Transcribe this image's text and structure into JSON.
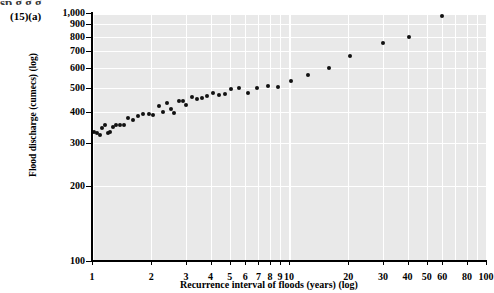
{
  "figure": {
    "label": "(15)(a)",
    "top_cropped_text": "sp g g g"
  },
  "chart_data": {
    "type": "scatter",
    "title": "",
    "xlabel": "Recurrence interval of floods (years) (log)",
    "ylabel": "Flood discharge (cumecs) (log)",
    "xscale": "log",
    "yscale": "log",
    "xlim": [
      1,
      100
    ],
    "ylim": [
      100,
      1000
    ],
    "grid": true,
    "legend": null,
    "marker_color": "#111111",
    "plot_background": "#e9e9e9",
    "gridline_color": "#ffffff",
    "xticks": [
      1,
      2,
      3,
      4,
      5,
      6,
      7,
      8,
      9,
      10,
      20,
      30,
      40,
      50,
      60,
      80,
      100
    ],
    "xtick_labels": [
      "1",
      "2",
      "3",
      "4",
      "5",
      "6",
      "7",
      "8",
      "9",
      "10",
      "20",
      "30",
      "40",
      "50",
      "60",
      "80",
      "100"
    ],
    "yticks": [
      100,
      200,
      300,
      400,
      500,
      600,
      700,
      800,
      900,
      1000
    ],
    "ytick_labels": [
      "100",
      "200",
      "300",
      "400",
      "500",
      "600",
      "700",
      "800",
      "900",
      "1,000"
    ],
    "points": [
      {
        "x": 1.02,
        "y": 330
      },
      {
        "x": 1.06,
        "y": 327
      },
      {
        "x": 1.1,
        "y": 322
      },
      {
        "x": 1.13,
        "y": 345
      },
      {
        "x": 1.16,
        "y": 355
      },
      {
        "x": 1.2,
        "y": 327
      },
      {
        "x": 1.24,
        "y": 330
      },
      {
        "x": 1.28,
        "y": 348
      },
      {
        "x": 1.33,
        "y": 352
      },
      {
        "x": 1.38,
        "y": 355
      },
      {
        "x": 1.45,
        "y": 353
      },
      {
        "x": 1.52,
        "y": 378
      },
      {
        "x": 1.62,
        "y": 372
      },
      {
        "x": 1.72,
        "y": 386
      },
      {
        "x": 1.82,
        "y": 392
      },
      {
        "x": 1.95,
        "y": 390
      },
      {
        "x": 2.05,
        "y": 388
      },
      {
        "x": 2.18,
        "y": 420
      },
      {
        "x": 2.28,
        "y": 398
      },
      {
        "x": 2.4,
        "y": 432
      },
      {
        "x": 2.52,
        "y": 412
      },
      {
        "x": 2.62,
        "y": 395
      },
      {
        "x": 2.75,
        "y": 443
      },
      {
        "x": 2.88,
        "y": 443
      },
      {
        "x": 3.0,
        "y": 425
      },
      {
        "x": 3.2,
        "y": 460
      },
      {
        "x": 3.4,
        "y": 450
      },
      {
        "x": 3.62,
        "y": 455
      },
      {
        "x": 3.85,
        "y": 462
      },
      {
        "x": 4.1,
        "y": 478
      },
      {
        "x": 4.4,
        "y": 468
      },
      {
        "x": 4.75,
        "y": 470
      },
      {
        "x": 5.1,
        "y": 492
      },
      {
        "x": 5.6,
        "y": 500
      },
      {
        "x": 6.2,
        "y": 478
      },
      {
        "x": 6.9,
        "y": 500
      },
      {
        "x": 7.8,
        "y": 508
      },
      {
        "x": 8.8,
        "y": 505
      },
      {
        "x": 10.2,
        "y": 530
      },
      {
        "x": 12.5,
        "y": 560
      },
      {
        "x": 16.0,
        "y": 600
      },
      {
        "x": 20.5,
        "y": 670
      },
      {
        "x": 30.0,
        "y": 755
      },
      {
        "x": 40.5,
        "y": 800
      },
      {
        "x": 60.0,
        "y": 975
      }
    ]
  }
}
